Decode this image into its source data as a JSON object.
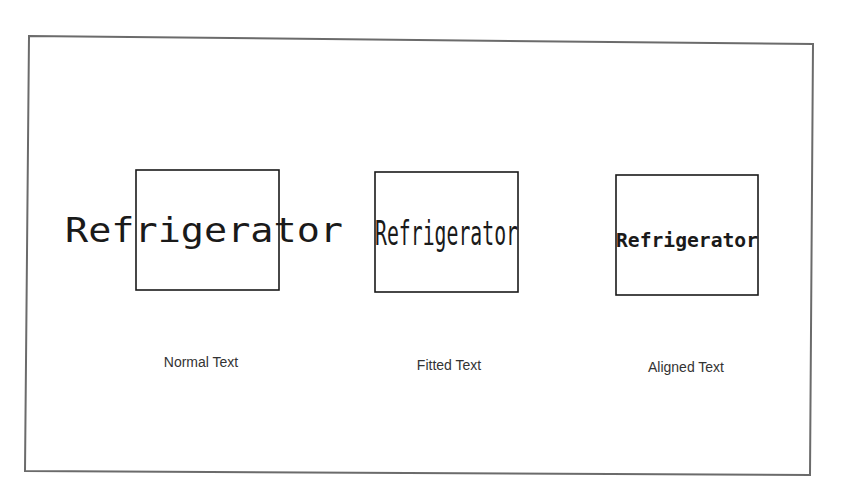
{
  "drawing": {
    "frame_color": "#6b6b6b",
    "line_color": "#1a1a1a",
    "label_color": "#333333",
    "examples": [
      {
        "id": "normal",
        "content": "Refrigerator",
        "caption": "Normal Text",
        "description": "Text at normal size, overflowing the box on both sides"
      },
      {
        "id": "fitted",
        "content": "Refrigerator",
        "caption": "Fitted Text",
        "description": "Text compressed horizontally to fit box width, keeping height"
      },
      {
        "id": "aligned",
        "content": "Refrigerator",
        "caption": "Aligned Text",
        "description": "Text scaled uniformly to fit box width"
      }
    ]
  }
}
